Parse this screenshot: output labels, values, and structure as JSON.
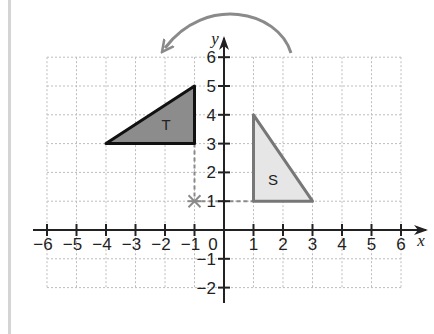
{
  "diagram": {
    "type": "coordinate-grid-rotation",
    "axes": {
      "x_label": "x",
      "y_label": "y",
      "x_ticks": [
        "−6",
        "−5",
        "−4",
        "−3",
        "−2",
        "−1",
        "1",
        "2",
        "3",
        "4",
        "5",
        "6"
      ],
      "y_ticks": [
        "6",
        "5",
        "4",
        "3",
        "2",
        "1",
        "−1",
        "−2"
      ],
      "origin_label": "0",
      "x_range": [
        -6,
        6
      ],
      "y_range": [
        -2,
        6
      ]
    },
    "shapes": {
      "T": {
        "label": "T",
        "vertices": [
          [
            -4,
            3
          ],
          [
            -1,
            5
          ],
          [
            -1,
            3
          ]
        ],
        "fill": "#8c8c8c",
        "stroke": "#111111"
      },
      "S": {
        "label": "S",
        "vertices": [
          [
            1,
            4
          ],
          [
            1,
            1
          ],
          [
            3,
            1
          ]
        ],
        "fill": "#e6e6e6",
        "stroke": "#777777"
      }
    },
    "centre_of_rotation": {
      "point": [
        -1,
        1
      ],
      "marker": "asterisk-icon",
      "color": "#8a8a8a"
    },
    "rotation_arrow": {
      "direction": "anticlockwise",
      "color": "#8a8a8a"
    },
    "colors": {
      "grid": "#bdbdbd",
      "axis": "#222222",
      "border": "#d4d4d4"
    }
  }
}
